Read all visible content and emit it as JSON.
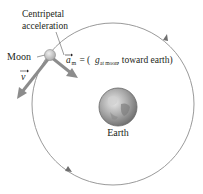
{
  "diagram": {
    "labels": {
      "centripetal_line1": "Centripetal",
      "centripetal_line2": "acceleration",
      "moon": "Moon",
      "earth": "Earth",
      "velocity_symbol": "v",
      "accel_symbol": "a",
      "accel_subscript": "m",
      "accel_eq_open": " = (",
      "g_symbol": "g",
      "g_subscript": "at moon",
      "accel_eq_close": ", toward earth)"
    },
    "colors": {
      "orbit": "#9a9a9a",
      "arrow": "#8c8c8c",
      "moon": "#c9c9c9",
      "earth_base": "#9e9e9e",
      "text": "#231f20"
    }
  }
}
